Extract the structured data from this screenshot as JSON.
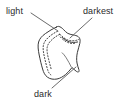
{
  "figure": {
    "background_color": "#ffffff",
    "ink_color": "#3a3a3a",
    "label_color": "#2b2b2b"
  },
  "labels": [
    {
      "id": "light",
      "text": "light",
      "position": "top-left",
      "points_to": "upper-left face of rock"
    },
    {
      "id": "darkest",
      "text": "darkest",
      "position": "top-right",
      "points_to": "crevice on upper-right of rock"
    },
    {
      "id": "dark",
      "text": "dark",
      "position": "bottom-center",
      "points_to": "lower-right underside of rock"
    }
  ],
  "leader_lines": [
    {
      "id": "leader-light",
      "from_x": 31,
      "from_y": 13,
      "to_x": 58,
      "to_y": 31
    },
    {
      "id": "leader-darkest",
      "from_x": 92,
      "from_y": 18,
      "to_x": 70,
      "to_y": 38
    },
    {
      "id": "leader-dark",
      "from_x": 52,
      "from_y": 88,
      "to_x": 76,
      "to_y": 67
    }
  ],
  "shape": {
    "outline_id": "rock-outline",
    "inner_contour_id": "shading-boundary",
    "inner_contour_style": "dotted",
    "stroke_width": 1
  }
}
